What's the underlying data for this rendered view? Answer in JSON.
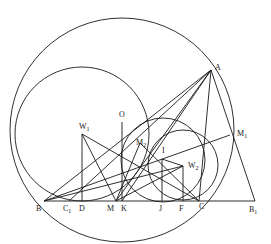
{
  "figure": {
    "header_fragment": "",
    "points": {
      "A": {
        "label": "A",
        "x": 211,
        "y": 70
      },
      "B": {
        "label": "B",
        "x": 44,
        "y": 201
      },
      "C": {
        "label": "C",
        "x": 199,
        "y": 201
      },
      "B1": {
        "label": "B",
        "sub": "1",
        "x": 255,
        "y": 201
      },
      "C1": {
        "label": "C",
        "sub": "1",
        "x": 69,
        "y": 201
      },
      "D": {
        "label": "D",
        "x": 82,
        "y": 201
      },
      "M": {
        "label": "M",
        "x": 116,
        "y": 201
      },
      "K": {
        "label": "K",
        "x": 122,
        "y": 201
      },
      "J": {
        "label": "J",
        "x": 162,
        "y": 201
      },
      "F": {
        "label": "F",
        "x": 183,
        "y": 201
      },
      "O": {
        "label": "O",
        "x": 122,
        "y": 118
      },
      "W1": {
        "label": "W",
        "sub": "1",
        "x": 82,
        "y": 134
      },
      "W2": {
        "label": "W",
        "sub": "2",
        "x": 183,
        "y": 166
      },
      "I": {
        "label": "I",
        "x": 162,
        "y": 159
      },
      "M1": {
        "label": "M",
        "sub": "1",
        "x": 230,
        "y": 135
      },
      "M2": {
        "label": "M",
        "sub": "2",
        "x": 140,
        "y": 143
      }
    },
    "circles": [
      {
        "name": "circumcircle",
        "cx": 122,
        "cy": 130,
        "r": 112
      },
      {
        "name": "circle-w1",
        "cx": 82,
        "cy": 134,
        "r": 67
      },
      {
        "name": "circle-i",
        "cx": 163,
        "cy": 160,
        "r": 42
      },
      {
        "name": "circle-w2",
        "cx": 183,
        "cy": 165,
        "r": 35
      }
    ]
  }
}
